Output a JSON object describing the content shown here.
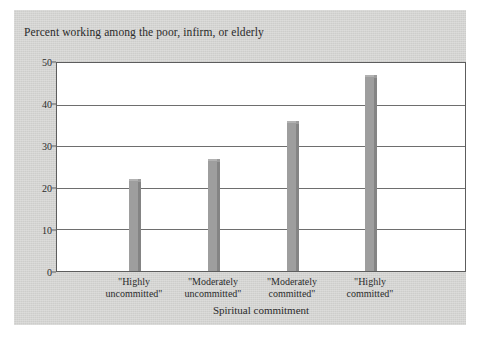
{
  "chart_data": {
    "type": "bar",
    "title": "Percent working among the poor, infirm, or elderly",
    "xlabel": "Spiritual commitment",
    "ylabel": "",
    "categories": [
      "\"Highly uncommitted\"",
      "\"Moderately uncommitted\"",
      "\"Moderately committed\"",
      "\"Highly committed\""
    ],
    "category_lines": [
      [
        "\"Highly",
        "uncommitted\""
      ],
      [
        "\"Moderately",
        "uncommitted\""
      ],
      [
        "\"Moderately",
        "committed\""
      ],
      [
        "\"Highly",
        "committed\""
      ]
    ],
    "values": [
      22,
      27,
      36,
      47
    ],
    "ylim": [
      0,
      50
    ],
    "yticks": [
      0,
      10,
      20,
      30,
      40,
      50
    ],
    "ytick_labels": [
      "0",
      "10",
      "20",
      "30",
      "40",
      "50"
    ],
    "grid": true,
    "legend": null,
    "bar_color": "#9e9e9e",
    "bar_side_color": "#848484",
    "panel_color": "#d2d2d0",
    "plot_background": "#ffffff",
    "axis_color": "#5d5d5d"
  }
}
